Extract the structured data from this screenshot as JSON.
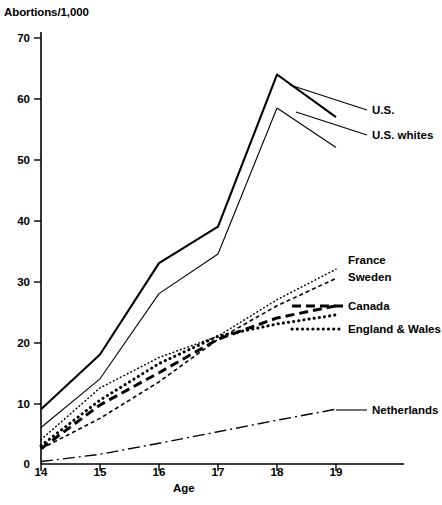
{
  "chart_data": {
    "type": "line",
    "title": "",
    "ylabel": "Abortions/1,000",
    "xlabel": "Age",
    "x": [
      14,
      15,
      16,
      17,
      18,
      19
    ],
    "xticks": [
      "14",
      "15",
      "16",
      "17",
      "18",
      "19"
    ],
    "yticks": [
      "0",
      "10",
      "20",
      "30",
      "40",
      "50",
      "60",
      "70"
    ],
    "xlim": [
      14,
      19
    ],
    "ylim": [
      0,
      70
    ],
    "grid": false,
    "legend_position": "right-inline-annotations",
    "series": [
      {
        "name": "U.S.",
        "style": "solid-thick",
        "values": [
          9,
          18,
          33,
          39,
          64,
          57
        ]
      },
      {
        "name": "U.S. whites",
        "style": "solid-thin",
        "values": [
          6,
          14,
          28,
          34.5,
          58.5,
          52
        ]
      },
      {
        "name": "France",
        "style": "dotted-fine",
        "values": [
          4,
          12.5,
          17.5,
          21,
          27,
          32
        ]
      },
      {
        "name": "Sweden",
        "style": "dashed-short",
        "values": [
          2.5,
          7.5,
          13.5,
          20.5,
          26,
          30.5
        ]
      },
      {
        "name": "Canada",
        "style": "dashed-long-bold",
        "values": [
          2.5,
          9.7,
          15,
          20.5,
          24,
          26
        ]
      },
      {
        "name": "England & Wales",
        "style": "dotted-bold",
        "values": [
          3,
          10.5,
          16.5,
          21,
          23,
          24.5
        ]
      },
      {
        "name": "Netherlands",
        "style": "dash-dot",
        "values": [
          0.4,
          1.6,
          3.4,
          5.3,
          7.2,
          9
        ]
      }
    ]
  },
  "axis": {
    "y_title": "Abortions/1,000",
    "x_title": "Age"
  },
  "legend": {
    "items": [
      {
        "label": "U.S.",
        "id": "us"
      },
      {
        "label": "U.S. whites",
        "id": "us-whites"
      },
      {
        "label": "France",
        "id": "france"
      },
      {
        "label": "Sweden",
        "id": "sweden"
      },
      {
        "label": "Canada",
        "id": "canada"
      },
      {
        "label": "England & Wales",
        "id": "england-wales"
      },
      {
        "label": "Netherlands",
        "id": "netherlands"
      }
    ]
  },
  "ticks": {
    "y": [
      "70",
      "60",
      "50",
      "40",
      "30",
      "20",
      "10",
      "0"
    ],
    "x": [
      "14",
      "15",
      "16",
      "17",
      "18",
      "19"
    ]
  },
  "colors": {
    "ink": "#000000",
    "background": "#ffffff"
  }
}
